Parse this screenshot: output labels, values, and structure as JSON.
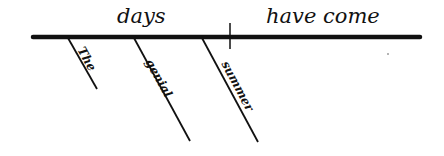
{
  "diagram": {
    "type": "sentence-diagram",
    "sentence": "The genial summer days have come.",
    "colors": {
      "ink": "#111111",
      "background": "#ffffff"
    },
    "baseline": {
      "subject": "days",
      "predicate": "have come"
    },
    "modifiers": [
      {
        "word": "The",
        "modifies": "days"
      },
      {
        "word": "genial",
        "modifies": "days"
      },
      {
        "word": "summer",
        "modifies": "days"
      }
    ]
  }
}
